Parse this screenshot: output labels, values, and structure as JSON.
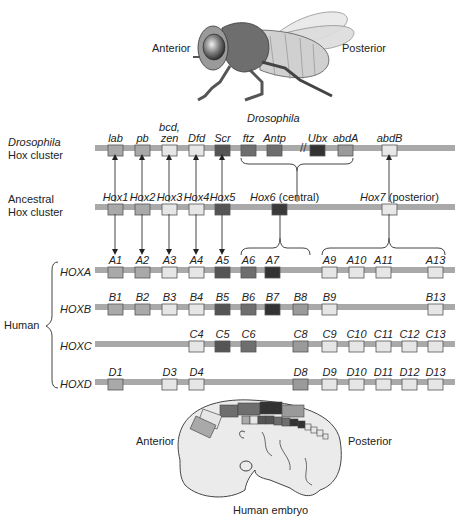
{
  "colors": {
    "bar": "#a9a9a9",
    "box_stroke": "#555555",
    "lab_group": "#a9a9a9",
    "light_group": "#e6e6e6",
    "scr_group": "#5a5a5a",
    "ftz_antp_group": "#6e6e6e",
    "ubx_group": "#333333",
    "abdA_group": "#9a9a9a",
    "abdB_group": "#e8e8e8"
  },
  "fly": {
    "anterior_label": "Anterior",
    "posterior_label": "Posterior",
    "caption": "Drosophila"
  },
  "drosophila_cluster": {
    "label_line1": "Drosophila",
    "label_line2": "Hox cluster",
    "genes": [
      {
        "name": "lab",
        "x": 108,
        "color": "#a9a9a9"
      },
      {
        "name": "pb",
        "x": 135,
        "color": "#a9a9a9"
      },
      {
        "name": "bcd, zen",
        "name_line1": "bcd,",
        "name_line2": "zen",
        "x": 162,
        "color": "#e6e6e6"
      },
      {
        "name": "Dfd",
        "x": 189,
        "color": "#e6e6e6"
      },
      {
        "name": "Scr",
        "x": 215,
        "color": "#555555"
      },
      {
        "name": "ftz",
        "x": 241,
        "color": "#6e6e6e"
      },
      {
        "name": "Antp",
        "x": 267,
        "color": "#6e6e6e"
      },
      {
        "name": "Ubx",
        "x": 310,
        "color": "#333333"
      },
      {
        "name": "abdA",
        "x": 338,
        "color": "#9a9a9a"
      },
      {
        "name": "abdB",
        "x": 382,
        "color": "#e8e8e8"
      }
    ],
    "break_mark": "//"
  },
  "ancestral_cluster": {
    "label_line1": "Ancestral",
    "label_line2": "Hox cluster",
    "genes": [
      {
        "name": "Hox1",
        "x": 108,
        "color": "#a9a9a9"
      },
      {
        "name": "Hox2",
        "x": 135,
        "color": "#a9a9a9"
      },
      {
        "name": "Hox3",
        "x": 162,
        "color": "#e6e6e6"
      },
      {
        "name": "Hox4",
        "x": 189,
        "color": "#e6e6e6"
      },
      {
        "name": "Hox5",
        "x": 215,
        "color": "#555555"
      },
      {
        "name": "Hox6",
        "suffix": "(central)",
        "x": 272,
        "color": "#3a3a3a"
      },
      {
        "name": "Hox7",
        "suffix": "(posterior)",
        "x": 382,
        "color": "#e8e8e8"
      }
    ]
  },
  "human": {
    "label": "Human",
    "clusters": [
      {
        "name": "HOXA",
        "genes": [
          {
            "name": "A1",
            "x": 108,
            "color": "#a9a9a9"
          },
          {
            "name": "A2",
            "x": 135,
            "color": "#a9a9a9"
          },
          {
            "name": "A3",
            "x": 162,
            "color": "#e6e6e6"
          },
          {
            "name": "A4",
            "x": 189,
            "color": "#e6e6e6"
          },
          {
            "name": "A5",
            "x": 215,
            "color": "#555555"
          },
          {
            "name": "A6",
            "x": 241,
            "color": "#6e6e6e"
          },
          {
            "name": "A7",
            "x": 265,
            "color": "#333333"
          },
          {
            "name": "A9",
            "x": 322,
            "color": "#e6e6e6"
          },
          {
            "name": "A10",
            "x": 349,
            "color": "#e6e6e6"
          },
          {
            "name": "A11",
            "x": 376,
            "color": "#e6e6e6"
          },
          {
            "name": "A13",
            "x": 428,
            "color": "#e6e6e6"
          }
        ]
      },
      {
        "name": "HOXB",
        "genes": [
          {
            "name": "B1",
            "x": 108,
            "color": "#a9a9a9"
          },
          {
            "name": "B2",
            "x": 135,
            "color": "#a9a9a9"
          },
          {
            "name": "B3",
            "x": 162,
            "color": "#e6e6e6"
          },
          {
            "name": "B4",
            "x": 189,
            "color": "#e6e6e6"
          },
          {
            "name": "B5",
            "x": 215,
            "color": "#555555"
          },
          {
            "name": "B6",
            "x": 241,
            "color": "#6e6e6e"
          },
          {
            "name": "B7",
            "x": 265,
            "color": "#333333"
          },
          {
            "name": "B8",
            "x": 293,
            "color": "#9a9a9a"
          },
          {
            "name": "B9",
            "x": 322,
            "color": "#e6e6e6"
          },
          {
            "name": "B13",
            "x": 428,
            "color": "#e6e6e6"
          }
        ]
      },
      {
        "name": "HOXC",
        "genes": [
          {
            "name": "C4",
            "x": 189,
            "color": "#e6e6e6"
          },
          {
            "name": "C5",
            "x": 215,
            "color": "#555555"
          },
          {
            "name": "C6",
            "x": 241,
            "color": "#6e6e6e"
          },
          {
            "name": "C8",
            "x": 293,
            "color": "#9a9a9a"
          },
          {
            "name": "C9",
            "x": 322,
            "color": "#e6e6e6"
          },
          {
            "name": "C10",
            "x": 349,
            "color": "#e6e6e6"
          },
          {
            "name": "C11",
            "x": 376,
            "color": "#e6e6e6"
          },
          {
            "name": "C12",
            "x": 402,
            "color": "#e6e6e6"
          },
          {
            "name": "C13",
            "x": 428,
            "color": "#e6e6e6"
          }
        ]
      },
      {
        "name": "HOXD",
        "genes": [
          {
            "name": "D1",
            "x": 108,
            "color": "#a9a9a9"
          },
          {
            "name": "D3",
            "x": 162,
            "color": "#e6e6e6"
          },
          {
            "name": "D4",
            "x": 189,
            "color": "#e6e6e6"
          },
          {
            "name": "D8",
            "x": 293,
            "color": "#9a9a9a"
          },
          {
            "name": "D9",
            "x": 322,
            "color": "#e6e6e6"
          },
          {
            "name": "D10",
            "x": 349,
            "color": "#e6e6e6"
          },
          {
            "name": "D11",
            "x": 376,
            "color": "#e6e6e6"
          },
          {
            "name": "D12",
            "x": 402,
            "color": "#e6e6e6"
          },
          {
            "name": "D13",
            "x": 428,
            "color": "#e6e6e6"
          }
        ]
      }
    ]
  },
  "embryo": {
    "anterior_label": "Anterior",
    "posterior_label": "Posterior",
    "caption": "Human embryo"
  }
}
